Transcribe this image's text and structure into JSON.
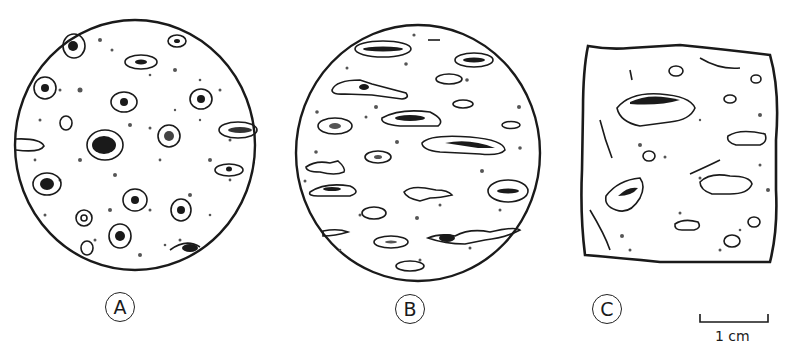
{
  "figure": {
    "panels": [
      {
        "id": "A",
        "label": "A",
        "shape": "circle",
        "description": "vesicles round, concentric rims"
      },
      {
        "id": "B",
        "label": "B",
        "shape": "circle",
        "description": "vesicles elongated, aligned horizontally"
      },
      {
        "id": "C",
        "label": "C",
        "shape": "irregular-square",
        "description": "irregular cavities with partial fill"
      }
    ],
    "scale_bar": {
      "label": "1 cm"
    },
    "colors": {
      "ink": "#1a1a1a",
      "paper": "#ffffff",
      "stipple": "#555555"
    }
  }
}
